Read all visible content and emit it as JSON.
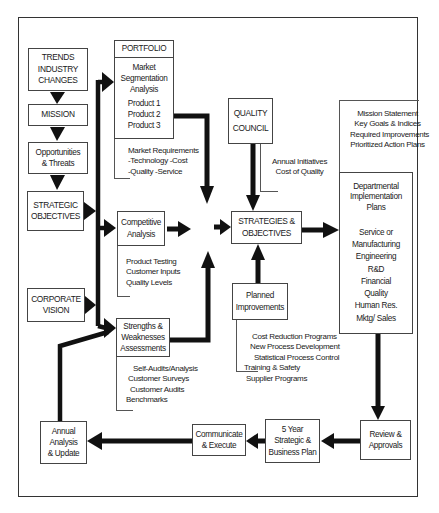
{
  "diagram": {
    "left_column": {
      "trends": [
        "TRENDS",
        "INDUSTRY",
        "CHANGES"
      ],
      "mission": "MISSION",
      "opportunities": [
        "Opportunities",
        "& Threats"
      ],
      "strategic_objectives": [
        "STRATEGIC",
        "OBJECTIVES"
      ],
      "corporate_vision": [
        "CORPORATE",
        "VISION"
      ],
      "annual_analysis": [
        "Annual",
        "Analysis",
        "& Update"
      ]
    },
    "portfolio": {
      "header": "PORTFOLIO",
      "body": [
        "Market",
        "Segmentation",
        "Analysis"
      ],
      "products": [
        "Product 1",
        "Product 2",
        "Product 3"
      ],
      "notes": [
        "Market Requirements",
        "-Technology -Cost",
        "-Quality -Service"
      ]
    },
    "competitive": {
      "title": [
        "Competitive",
        "Analysis"
      ],
      "notes": [
        "Product Testing",
        "Customer Inputs",
        "Quality Levels"
      ]
    },
    "strengths": {
      "title": [
        "Strengths &",
        "Weaknesses",
        "Assessments"
      ],
      "notes": [
        "Self-Audits/Analysis",
        "Customer Surveys",
        "Customer Audits",
        "Benchmarks"
      ]
    },
    "quality_council": {
      "title": [
        "QUALITY",
        "COUNCIL"
      ],
      "notes": [
        "Annual Initiatives",
        "Cost of Quality"
      ]
    },
    "strategies": {
      "title": [
        "STRATEGIES &",
        "OBJECTIVES"
      ]
    },
    "planned": {
      "title": [
        "Planned",
        "Improvements"
      ],
      "notes": [
        "Cost Reduction Programs",
        "New Process Development",
        "Statistical Process Control",
        "Training & Safety",
        "Supplier Programs"
      ]
    },
    "right_column": {
      "mission_notes": [
        "Mission Statement",
        "Key Goals & Indices",
        "Required Improvements",
        "Prioritized Action Plans"
      ],
      "departmental": [
        "Departmental",
        "Implementation",
        "Plans"
      ],
      "departments": [
        "Service or",
        "Manufacturing",
        "Engineering",
        "R&D",
        "Financial",
        "Quality",
        "Human Res.",
        "Mktg/ Sales"
      ]
    },
    "bottom_row": {
      "review": [
        "Review &",
        "Approvals"
      ],
      "five_year": [
        "5 Year",
        "Strategic &",
        "Business Plan"
      ],
      "communicate": [
        "Communicate",
        "& Execute"
      ]
    }
  }
}
